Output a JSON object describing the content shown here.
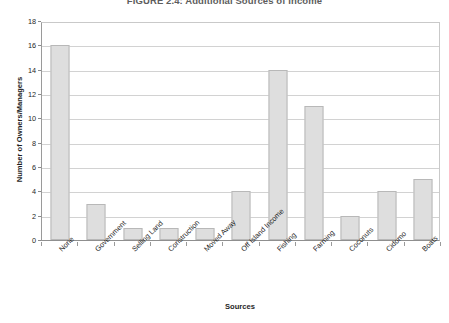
{
  "chart_data": {
    "type": "bar",
    "title": "FIGURE 2.4: Additional Sources of Income",
    "xlabel": "Sources",
    "ylabel": "Number of Owners/Managers",
    "categories": [
      "None",
      "Government",
      "Selling Land",
      "Construction",
      "Moved Away",
      "Off Island Income",
      "Fishing",
      "Farming",
      "Coconuts",
      "Cidomo",
      "Boats"
    ],
    "values": [
      16,
      3,
      1,
      1,
      1,
      4,
      14,
      11,
      2,
      4,
      5
    ],
    "ylim": [
      0,
      18
    ],
    "ytick_step": 2,
    "yticks": [
      "18",
      "16",
      "14",
      "12",
      "10",
      "8",
      "6",
      "4",
      "2",
      "0"
    ],
    "grid": true,
    "legend": "none",
    "bar_color": "#dedede",
    "bar_border_color": "#b8b8b8",
    "grid_color": "#d2d2d2",
    "axis_color": "#8f8f8f"
  }
}
